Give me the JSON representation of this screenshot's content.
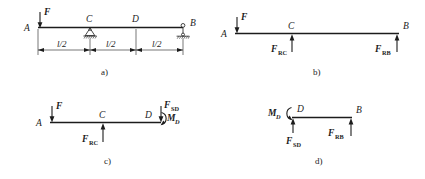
{
  "figure": {
    "panels": [
      {
        "key": "a",
        "caption": "a)",
        "nodes": {
          "A": "A",
          "B": "B",
          "C": "C",
          "D": "D"
        },
        "loads": {
          "F": "F"
        },
        "dimensions": [
          "l/2",
          "l/2",
          "l/2"
        ],
        "supports": [
          {
            "at": "C",
            "type": "pin-support-icon"
          },
          {
            "at": "B",
            "type": "roller-pin-support-icon"
          }
        ]
      },
      {
        "key": "b",
        "caption": "b)",
        "nodes": {
          "A": "A",
          "B": "B",
          "C": "C"
        },
        "loads": {
          "F": "F",
          "FRC": "F",
          "FRC_sub": "RC",
          "FRB": "F",
          "FRB_sub": "RB"
        }
      },
      {
        "key": "c",
        "caption": "c)",
        "nodes": {
          "A": "A",
          "C": "C",
          "D": "D"
        },
        "loads": {
          "F": "F",
          "FRC": "F",
          "FRC_sub": "RC",
          "FSD": "F",
          "FSD_sub": "SD",
          "MD": "M",
          "MD_sub": "D"
        }
      },
      {
        "key": "d",
        "caption": "d)",
        "nodes": {
          "D": "D",
          "B": "B"
        },
        "loads": {
          "MD": "M",
          "MD_sub": "D",
          "FSD": "F",
          "FSD_sub": "SD",
          "FRB": "F",
          "FRB_sub": "RB"
        }
      }
    ],
    "colors": {
      "ink": "#1c1c1c",
      "background": "#ffffff"
    }
  }
}
